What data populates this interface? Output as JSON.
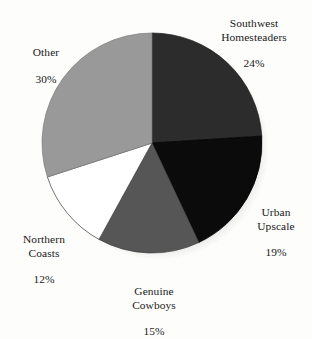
{
  "background_color": "#fdfdfc",
  "chart_data": {
    "type": "pie",
    "title": "",
    "subtitle": "",
    "xlabel": "",
    "ylabel": "",
    "legend_position": "none",
    "grid": false,
    "labels_outside": true,
    "start_angle_deg": 0,
    "direction": "clockwise",
    "center": {
      "x": 152,
      "y": 143
    },
    "radius": 110,
    "categories": [
      "Southwest Homesteaders",
      "Urban Upscale",
      "Genuine Cowboys",
      "Northern Coasts",
      "Other"
    ],
    "values": [
      24,
      19,
      15,
      12,
      30
    ],
    "units": "%",
    "slices": [
      {
        "name": "Southwest Homesteaders",
        "name_line1": "Southwest",
        "name_line2": "Homesteaders",
        "value": 24,
        "value_label": "24%",
        "color": "#2c2c2c",
        "outline": "#1a1a1a",
        "start_deg": 0,
        "end_deg": 86.4
      },
      {
        "name": "Urban Upscale",
        "name_line1": "Urban",
        "name_line2": "Upscale",
        "value": 19,
        "value_label": "19%",
        "color": "#0b0b0b",
        "outline": "#000000",
        "start_deg": 86.4,
        "end_deg": 154.8
      },
      {
        "name": "Genuine Cowboys",
        "name_line1": "Genuine",
        "name_line2": "Cowboys",
        "value": 15,
        "value_label": "15%",
        "color": "#565656",
        "outline": "#3d3d3d",
        "start_deg": 154.8,
        "end_deg": 208.8
      },
      {
        "name": "Northern Coasts",
        "name_line1": "Northern",
        "name_line2": "Coasts",
        "value": 12,
        "value_label": "12%",
        "color": "#ffffff",
        "outline": "#3a3a3a",
        "start_deg": 208.8,
        "end_deg": 252.0
      },
      {
        "name": "Other",
        "name_line1": "Other",
        "name_line2": "",
        "value": 30,
        "value_label": "30%",
        "color": "#999999",
        "outline": "#7b7b7b",
        "start_deg": 252.0,
        "end_deg": 360.0
      }
    ],
    "labels": {
      "southwest": {
        "name": "Southwest\nHomesteaders",
        "pct": "24%"
      },
      "urban": {
        "name": "Urban\nUpscale",
        "pct": "19%"
      },
      "cowboys": {
        "name": "Genuine\nCowboys",
        "pct": "15%"
      },
      "northern": {
        "name": "Northern\nCoasts",
        "pct": "12%"
      },
      "other": {
        "name": "Other",
        "pct": "30%"
      }
    }
  }
}
